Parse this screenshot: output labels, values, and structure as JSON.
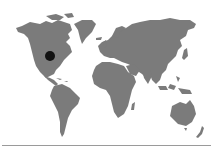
{
  "map": {
    "type": "world-map",
    "land_color": "#7b7b7b",
    "background_color": "#ffffff",
    "markers": [
      {
        "name": "location-marker",
        "region": "Eastern United States",
        "x": 50,
        "y": 56,
        "r": 5,
        "color": "#111111"
      }
    ]
  },
  "footer": {
    "rule_color": "#9a9a9a"
  }
}
